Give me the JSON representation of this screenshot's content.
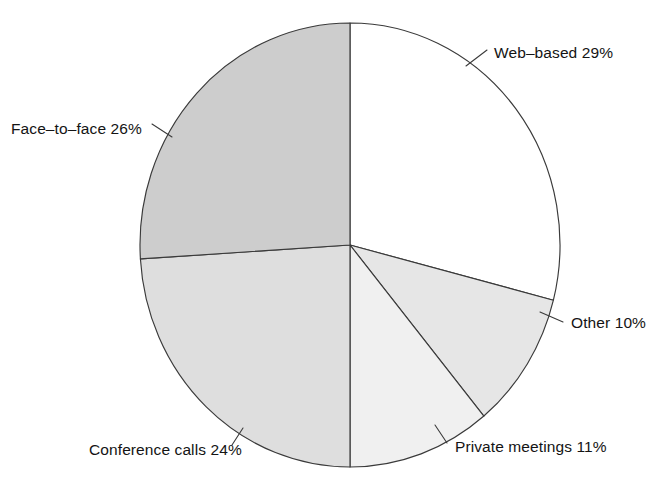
{
  "chart_data": {
    "type": "pie",
    "title": "",
    "subtitle": "",
    "xlabel": "",
    "ylabel": "",
    "legend_position": "none",
    "grid": false,
    "labels_show_percent": true,
    "total_percent": 100,
    "categories": [
      "Web-based",
      "Other",
      "Private meetings",
      "Conference calls",
      "Face-to-face"
    ],
    "values": [
      29,
      10,
      11,
      24,
      26
    ],
    "slices": [
      {
        "name": "Web-based",
        "value": 29,
        "label": "Web–based 29%",
        "color": "#ffffff",
        "start_angle_deg": 0,
        "end_angle_deg": 104.4,
        "label_x": 494,
        "label_y": 58,
        "label_anchor": "start",
        "leader_x1": 466,
        "leader_y1": 66,
        "leader_x2": 487,
        "leader_y2": 50
      },
      {
        "name": "Other",
        "value": 10,
        "label": "Other 10%",
        "color": "#e6e6e6",
        "start_angle_deg": 104.4,
        "end_angle_deg": 140.4,
        "label_x": 571,
        "label_y": 328,
        "label_anchor": "start",
        "leader_x1": 540,
        "leader_y1": 312,
        "leader_x2": 563,
        "leader_y2": 322
      },
      {
        "name": "Private meetings",
        "value": 11,
        "label": "Private meetings 11%",
        "color": "#f0f0f0",
        "start_angle_deg": 140.4,
        "end_angle_deg": 180.0,
        "label_x": 455,
        "label_y": 452,
        "label_anchor": "start",
        "leader_x1": 435,
        "leader_y1": 425,
        "leader_x2": 447,
        "leader_y2": 443
      },
      {
        "name": "Conference calls",
        "value": 24,
        "label": "Conference calls 24%",
        "color": "#dedede",
        "start_angle_deg": 180.0,
        "end_angle_deg": 266.4,
        "label_x": 89,
        "label_y": 455,
        "label_anchor": "start",
        "leader_x1": 243,
        "leader_y1": 428,
        "leader_x2": 232,
        "leader_y2": 445
      },
      {
        "name": "Face-to-face",
        "value": 26,
        "label": "Face–to–face 26%",
        "color": "#cdcdcd",
        "start_angle_deg": 266.4,
        "end_angle_deg": 360.0,
        "label_x": 11,
        "label_y": 134,
        "label_anchor": "start",
        "leader_x1": 172,
        "leader_y1": 137,
        "leader_x2": 152,
        "leader_y2": 124
      }
    ],
    "geometry": {
      "center_x": 350,
      "center_y": 245,
      "radius_x": 210,
      "radius_y": 222,
      "start_offset_deg": -90,
      "direction": "clockwise",
      "outline_color": "#3a3a3a"
    }
  }
}
